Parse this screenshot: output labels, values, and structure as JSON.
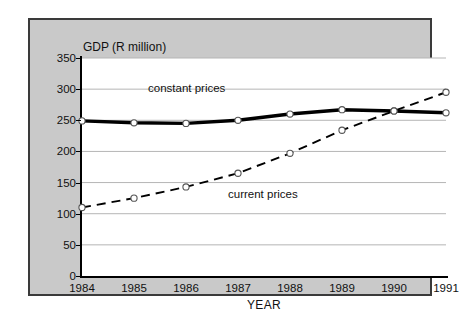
{
  "chart_data": {
    "type": "line",
    "title": "",
    "xlabel": "YEAR",
    "ylabel": "GDP (R million)",
    "x": [
      "1984",
      "1985",
      "1986",
      "1987",
      "1988",
      "1989",
      "1990",
      "1991"
    ],
    "xlim": [
      1984,
      1991
    ],
    "ylim": [
      0,
      350
    ],
    "yticks": [
      0,
      50,
      100,
      150,
      200,
      250,
      300,
      350
    ],
    "grid": "horizontal",
    "legend": "inline-annotations",
    "series": [
      {
        "name": "constant prices",
        "style": "solid-thick",
        "color": "#000000",
        "marker": "open-circle",
        "values": [
          249,
          246,
          245,
          250,
          260,
          267,
          265,
          262
        ]
      },
      {
        "name": "current prices",
        "style": "dashed",
        "color": "#000000",
        "marker": "open-circle",
        "values": [
          110,
          125,
          143,
          165,
          197,
          234,
          265,
          295
        ]
      }
    ],
    "annotations": [
      {
        "text": "constant prices",
        "series": "constant prices"
      },
      {
        "text": "current prices",
        "series": "current prices"
      }
    ]
  },
  "axes": {
    "y_title": "GDP (R million)",
    "x_title": "YEAR",
    "y_tick_labels": [
      "350",
      "300",
      "250",
      "200",
      "150",
      "100",
      "50",
      "0"
    ],
    "x_tick_labels": [
      "1984",
      "1985",
      "1986",
      "1987",
      "1988",
      "1989",
      "1990",
      "1991"
    ]
  },
  "annotations": {
    "constant_prices": "constant prices",
    "current_prices": "current prices"
  },
  "colors": {
    "panel_background": "#c9c9c9",
    "panel_border": "#3a3a3a",
    "plot_background": "#ffffff",
    "gridline": "#b5b5b5",
    "axis": "#000000",
    "series_line": "#000000",
    "marker_fill": "#ffffff"
  }
}
